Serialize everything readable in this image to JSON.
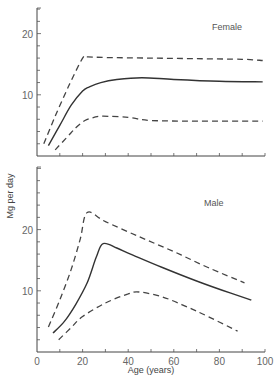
{
  "chart_data": [
    {
      "type": "line",
      "panel": "top",
      "title": "Female",
      "xlabel": "Age (years)",
      "ylabel": "Mg per day",
      "xlim": [
        0,
        100
      ],
      "ylim": [
        0,
        24
      ],
      "x_ticks": [
        0,
        10,
        20,
        30,
        40,
        50,
        60,
        70,
        80,
        90,
        100
      ],
      "y_tick_labels": [
        "10",
        "20"
      ],
      "grid": false,
      "series": [
        {
          "name": "upper limit",
          "style": "dashed",
          "x": [
            3,
            8,
            14,
            20,
            22,
            30,
            50,
            70,
            90,
            99
          ],
          "y": [
            2.0,
            6.5,
            11.5,
            16.0,
            16.2,
            16.1,
            16.0,
            15.9,
            15.8,
            15.6
          ]
        },
        {
          "name": "mean",
          "style": "solid",
          "x": [
            5,
            10,
            15,
            20,
            23,
            28,
            35,
            46,
            60,
            80,
            99
          ],
          "y": [
            1.7,
            5.0,
            8.3,
            10.6,
            11.3,
            12.0,
            12.5,
            12.8,
            12.5,
            12.2,
            12.1
          ]
        },
        {
          "name": "lower limit",
          "style": "dashed",
          "x": [
            8,
            13,
            17,
            21,
            25,
            29,
            40,
            50,
            70,
            99
          ],
          "y": [
            1.0,
            3.0,
            4.6,
            5.8,
            6.3,
            6.5,
            6.3,
            5.8,
            5.7,
            5.7
          ]
        }
      ]
    },
    {
      "type": "line",
      "panel": "bottom",
      "title": "Male",
      "xlabel": "Age (years)",
      "ylabel": "Mg per day",
      "xlim": [
        0,
        100
      ],
      "ylim": [
        0,
        30
      ],
      "x_ticks": [
        0,
        10,
        20,
        30,
        40,
        50,
        60,
        70,
        80,
        90,
        100
      ],
      "x_tick_labels": [
        "0",
        "20",
        "40",
        "60",
        "80",
        "100"
      ],
      "y_tick_labels": [
        "10",
        "20"
      ],
      "grid": false,
      "series": [
        {
          "name": "upper limit",
          "style": "dashed",
          "x": [
            5,
            10,
            15,
            19,
            22,
            30,
            45,
            60,
            75,
            91
          ],
          "y": [
            4.1,
            8.5,
            13.5,
            18.5,
            22.8,
            21.3,
            18.8,
            16.4,
            13.8,
            11.3
          ]
        },
        {
          "name": "mean",
          "style": "solid",
          "x": [
            7,
            12,
            17,
            22,
            26,
            29,
            35,
            41,
            55,
            70,
            85,
            94
          ],
          "y": [
            3.1,
            5.0,
            7.8,
            11.3,
            15.5,
            17.7,
            17.0,
            16.0,
            13.8,
            11.6,
            9.6,
            8.5
          ]
        },
        {
          "name": "lower limit",
          "style": "dashed",
          "x": [
            9.5,
            15,
            20,
            30,
            40,
            45,
            55,
            65,
            75,
            88
          ],
          "y": [
            2.0,
            4.0,
            5.8,
            8.0,
            9.5,
            9.8,
            9.0,
            7.5,
            5.8,
            3.4
          ]
        }
      ]
    }
  ],
  "labels": {
    "female": "Female",
    "male": "Male",
    "ylabel": "Mg per day",
    "xlabel": "Age (years)"
  }
}
